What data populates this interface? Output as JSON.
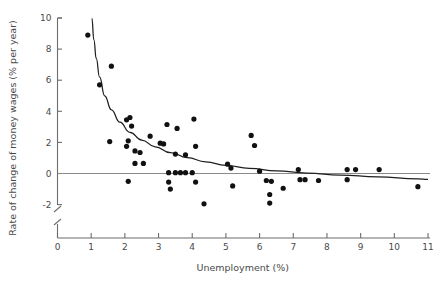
{
  "chart_data": {
    "type": "scatter",
    "title": "",
    "xlabel": "Unemployment (%)",
    "ylabel": "Rate of change of money wages (% per year)",
    "xlim": [
      0,
      11
    ],
    "ylim": [
      -3,
      10
    ],
    "grid": false,
    "legend": "none",
    "x_ticks": [
      "0",
      "1",
      "2",
      "3",
      "4",
      "5",
      "6",
      "7",
      "8",
      "9",
      "10",
      "11"
    ],
    "y_ticks": [
      "10",
      "8",
      "6",
      "4",
      "2",
      "0",
      "-2"
    ],
    "y_axis_break": true,
    "zero_reference_line": true,
    "point_color": "#111111",
    "curve_color": "#1f1f1f",
    "axis_color": "#6d6d6d",
    "points": [
      [
        0.9,
        8.9
      ],
      [
        1.25,
        5.7
      ],
      [
        1.6,
        6.9
      ],
      [
        1.55,
        2.05
      ],
      [
        2.05,
        3.45
      ],
      [
        2.15,
        3.6
      ],
      [
        2.2,
        3.05
      ],
      [
        2.1,
        2.1
      ],
      [
        2.05,
        1.75
      ],
      [
        2.3,
        1.45
      ],
      [
        2.45,
        1.35
      ],
      [
        2.3,
        0.65
      ],
      [
        2.55,
        0.65
      ],
      [
        2.1,
        -0.5
      ],
      [
        2.75,
        2.4
      ],
      [
        3.05,
        1.95
      ],
      [
        3.15,
        1.9
      ],
      [
        3.25,
        3.15
      ],
      [
        3.55,
        2.9
      ],
      [
        3.5,
        1.25
      ],
      [
        3.8,
        1.2
      ],
      [
        3.3,
        0.05
      ],
      [
        3.5,
        0.05
      ],
      [
        3.65,
        0.05
      ],
      [
        3.8,
        0.05
      ],
      [
        3.3,
        -0.55
      ],
      [
        3.35,
        -1.0
      ],
      [
        4.05,
        3.5
      ],
      [
        4.1,
        1.75
      ],
      [
        4.0,
        0.05
      ],
      [
        4.1,
        -0.55
      ],
      [
        4.35,
        -1.95
      ],
      [
        5.05,
        0.6
      ],
      [
        5.15,
        0.35
      ],
      [
        5.2,
        -0.8
      ],
      [
        5.75,
        2.45
      ],
      [
        5.85,
        1.8
      ],
      [
        6.0,
        0.15
      ],
      [
        6.2,
        -0.45
      ],
      [
        6.35,
        -0.5
      ],
      [
        6.3,
        -1.35
      ],
      [
        6.3,
        -1.9
      ],
      [
        6.7,
        -0.95
      ],
      [
        7.15,
        0.25
      ],
      [
        7.2,
        -0.4
      ],
      [
        7.35,
        -0.4
      ],
      [
        7.75,
        -0.45
      ],
      [
        8.6,
        0.25
      ],
      [
        8.6,
        -0.4
      ],
      [
        8.85,
        0.25
      ],
      [
        9.55,
        0.25
      ],
      [
        10.7,
        -0.85
      ]
    ],
    "fit_curve_points": [
      [
        1.02,
        10.0
      ],
      [
        1.08,
        8.6
      ],
      [
        1.15,
        7.4
      ],
      [
        1.25,
        6.2
      ],
      [
        1.4,
        5.0
      ],
      [
        1.6,
        4.1
      ],
      [
        1.85,
        3.3
      ],
      [
        2.15,
        2.65
      ],
      [
        2.5,
        2.15
      ],
      [
        2.9,
        1.72
      ],
      [
        3.35,
        1.35
      ],
      [
        3.85,
        1.02
      ],
      [
        4.4,
        0.75
      ],
      [
        5.0,
        0.52
      ],
      [
        5.7,
        0.33
      ],
      [
        6.5,
        0.17
      ],
      [
        7.4,
        0.03
      ],
      [
        8.4,
        -0.1
      ],
      [
        9.5,
        -0.22
      ],
      [
        10.7,
        -0.35
      ],
      [
        11.0,
        -0.38
      ]
    ]
  }
}
